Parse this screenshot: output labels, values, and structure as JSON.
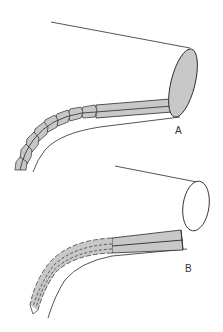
{
  "figure": {
    "panels": [
      {
        "id": "A",
        "label": "A",
        "description": "Rod ending in filled shaded ellipse with segmented curved section"
      },
      {
        "id": "B",
        "label": "B",
        "description": "Rod ending in open ellipse with dashed-outline segmented curved section"
      }
    ]
  },
  "colors": {
    "line": "#2a2a2a",
    "fill": "#c8c8c8",
    "background": "#ffffff"
  }
}
